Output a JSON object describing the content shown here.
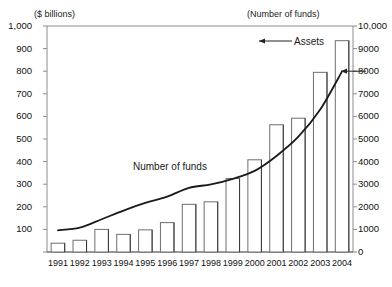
{
  "chart_data": {
    "type": "bar",
    "title": "",
    "xlabel": "",
    "ylabel": "($ billions)",
    "y2label": "(Number of funds)",
    "categories": [
      "1991",
      "1992",
      "1993",
      "1994",
      "1995",
      "1996",
      "1997",
      "1998",
      "1999",
      "2000",
      "2001",
      "2002",
      "2003",
      "2004"
    ],
    "ylim": [
      0,
      1000
    ],
    "y2lim": [
      0,
      10000
    ],
    "grid": false,
    "legend_position": "inline-annotations",
    "series": [
      {
        "name": "Assets",
        "type": "bar",
        "axis": "left",
        "unit": "$ billions",
        "values": [
          39,
          52,
          100,
          78,
          98,
          130,
          211,
          222,
          325,
          408,
          563,
          592,
          795,
          935
        ]
      },
      {
        "name": "Number of funds",
        "type": "line",
        "axis": "right",
        "unit": "funds",
        "values": [
          960,
          1080,
          1450,
          1830,
          2170,
          2450,
          2840,
          2990,
          3240,
          3590,
          4250,
          5100,
          6300,
          7990
        ]
      }
    ],
    "left_ticks": [
      "0",
      "100",
      "200",
      "300",
      "400",
      "500",
      "600",
      "700",
      "800",
      "900",
      "1,000"
    ],
    "right_ticks": [
      "0",
      "1000",
      "2000",
      "3000",
      "4000",
      "5000",
      "6000",
      "7000",
      "8000",
      "9000",
      "10,000"
    ],
    "annotations": [
      {
        "name": "assets-annotation",
        "text": "Assets",
        "arrow": "left"
      },
      {
        "name": "number-of-funds-annotation",
        "text": "Number of funds",
        "arrow": "none"
      },
      {
        "name": "funds-endpoint-arrow",
        "text": "",
        "arrow": "left"
      }
    ],
    "colors": {
      "bar_stroke": "#6e6e6e",
      "bar_fill": "#ffffff",
      "line": "#1a1a1a",
      "axis": "#8c8c8c",
      "text": "#111111"
    }
  }
}
